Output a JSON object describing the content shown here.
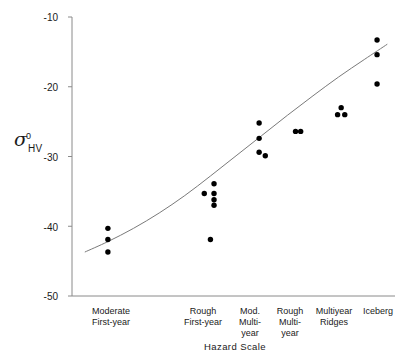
{
  "chart_data": {
    "type": "scatter",
    "title": "",
    "xlabel": "Hazard Scale",
    "ylabel": "σ⁰HV",
    "ylabel_parts": {
      "symbol": "σ",
      "superscript": "0",
      "subscript": "HV"
    },
    "categories": [
      "Moderate First-year",
      "Rough First-year",
      "Mod. Multi-year",
      "Rough Multi-year",
      "Multiyear Ridges",
      "Iceberg"
    ],
    "category_lines": [
      [
        "Moderate",
        "First-year"
      ],
      [
        "Rough",
        "First-year"
      ],
      [
        "Mod.",
        "Multi-",
        "year"
      ],
      [
        "Rough",
        "Multi-",
        "year"
      ],
      [
        "Multiyear",
        "Ridges"
      ],
      [
        "Iceberg"
      ]
    ],
    "ylim": [
      -50,
      -10
    ],
    "yticks": [
      -10,
      -20,
      -30,
      -40,
      -50
    ],
    "ytick_labels": [
      "-10",
      "-20",
      "-30",
      "-40",
      "-50"
    ],
    "xlim": [
      0.3,
      6.6
    ],
    "grid": false,
    "legend": false,
    "marker": "filled-circle",
    "marker_color": "#000000",
    "trend_line": {
      "style": "solid",
      "color": "#7a7a7a",
      "description": "smooth increasing curve",
      "points": [
        {
          "x": 0.55,
          "y": -43.7
        },
        {
          "x": 1.0,
          "y": -42.2
        },
        {
          "x": 1.5,
          "y": -40.3
        },
        {
          "x": 2.0,
          "y": -38.1
        },
        {
          "x": 2.5,
          "y": -35.6
        },
        {
          "x": 3.0,
          "y": -32.8
        },
        {
          "x": 3.5,
          "y": -29.9
        },
        {
          "x": 4.0,
          "y": -27.0
        },
        {
          "x": 4.5,
          "y": -24.1
        },
        {
          "x": 5.0,
          "y": -21.3
        },
        {
          "x": 5.5,
          "y": -18.6
        },
        {
          "x": 6.0,
          "y": -16.1
        },
        {
          "x": 6.45,
          "y": -13.9
        }
      ]
    },
    "series": [
      {
        "name": "sigma0 HV observations",
        "points": [
          {
            "x": 1.0,
            "y": -40.3,
            "category": "Moderate First-year"
          },
          {
            "x": 1.0,
            "y": -41.9,
            "category": "Moderate First-year"
          },
          {
            "x": 1.0,
            "y": -43.7,
            "category": "Moderate First-year"
          },
          {
            "x": 3.07,
            "y": -33.9,
            "category": "Rough First-year"
          },
          {
            "x": 2.88,
            "y": -35.3,
            "category": "Rough First-year"
          },
          {
            "x": 3.07,
            "y": -35.3,
            "category": "Rough First-year"
          },
          {
            "x": 3.07,
            "y": -36.2,
            "category": "Rough First-year"
          },
          {
            "x": 3.07,
            "y": -37.0,
            "category": "Rough First-year"
          },
          {
            "x": 3.0,
            "y": -41.9,
            "category": "Rough First-year"
          },
          {
            "x": 3.95,
            "y": -25.2,
            "category": "Mod. Multi-year"
          },
          {
            "x": 3.95,
            "y": -27.4,
            "category": "Mod. Multi-year"
          },
          {
            "x": 3.95,
            "y": -29.4,
            "category": "Mod. Multi-year"
          },
          {
            "x": 4.07,
            "y": -29.9,
            "category": "Mod. Multi-year"
          },
          {
            "x": 4.66,
            "y": -26.4,
            "category": "Rough Multi-year"
          },
          {
            "x": 4.76,
            "y": -26.4,
            "category": "Rough Multi-year"
          },
          {
            "x": 5.55,
            "y": -23.0,
            "category": "Multiyear Ridges"
          },
          {
            "x": 5.48,
            "y": -24.0,
            "category": "Multiyear Ridges"
          },
          {
            "x": 5.62,
            "y": -24.0,
            "category": "Multiyear Ridges"
          },
          {
            "x": 6.25,
            "y": -13.3,
            "category": "Iceberg"
          },
          {
            "x": 6.25,
            "y": -15.4,
            "category": "Iceberg"
          },
          {
            "x": 6.25,
            "y": -19.6,
            "category": "Iceberg"
          }
        ]
      }
    ]
  },
  "axes": {
    "y_axis_color": "#8a8a8a",
    "x_axis_color": "#8a8a8a",
    "tick_color": "#8a8a8a"
  }
}
